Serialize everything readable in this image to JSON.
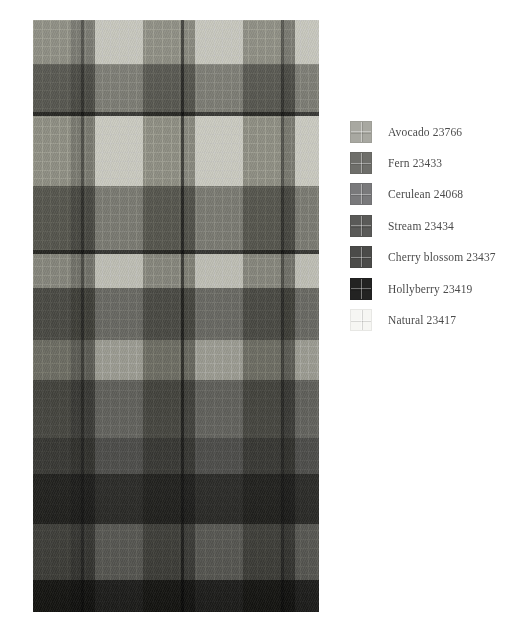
{
  "page": {
    "background": "#ffffff",
    "width": 524,
    "height": 636,
    "type": "fabric-swatch-colour-key"
  },
  "fabric": {
    "name": "plaid-swatch",
    "description": "Woven tartan / plaid fabric swatch photograph",
    "region": {
      "x": 33,
      "y": 20,
      "width": 286,
      "height": 592
    },
    "base_color": "#b9b9b1",
    "warp_columns": [
      {
        "start": 0,
        "width": 38,
        "color": "#a9a9a1",
        "yarn": "Avocado 23766"
      },
      {
        "start": 38,
        "width": 10,
        "color": "#8e8e88",
        "yarn": "Cerulean 24068"
      },
      {
        "start": 48,
        "width": 3,
        "color": "#5c5c58",
        "yarn": "Stream 23434"
      },
      {
        "start": 51,
        "width": 11,
        "color": "#8e8e88",
        "yarn": "Cerulean 24068"
      },
      {
        "start": 62,
        "width": 48,
        "color": "#f2f2ee",
        "yarn": "Natural 23417"
      },
      {
        "start": 110,
        "width": 38,
        "color": "#a9a9a1",
        "yarn": "Avocado 23766"
      },
      {
        "start": 148,
        "width": 3,
        "color": "#4a4a46",
        "yarn": "Hollyberry 23419"
      },
      {
        "start": 151,
        "width": 11,
        "color": "#a0a099",
        "yarn": "Cerulean 24068"
      },
      {
        "start": 162,
        "width": 48,
        "color": "#f2f2ee",
        "yarn": "Natural 23417"
      },
      {
        "start": 210,
        "width": 38,
        "color": "#a9a9a1",
        "yarn": "Avocado 23766"
      },
      {
        "start": 248,
        "width": 3,
        "color": "#5c5c58",
        "yarn": "Stream 23434"
      },
      {
        "start": 251,
        "width": 11,
        "color": "#8e8e88",
        "yarn": "Cerulean 24068"
      },
      {
        "start": 262,
        "width": 24,
        "color": "#f2f2ee",
        "yarn": "Natural 23417"
      }
    ],
    "weft_rows": [
      {
        "start": 0,
        "height": 44,
        "color": "#cfcfc8",
        "yarn": "Avocado 23766"
      },
      {
        "start": 44,
        "height": 48,
        "color": "#7f7f79",
        "yarn": "Fern 23433"
      },
      {
        "start": 92,
        "height": 4,
        "color": "#3a3a37",
        "yarn": "Hollyberry 23419"
      },
      {
        "start": 96,
        "height": 70,
        "color": "#d5d5ce",
        "yarn": "Avocado 23766"
      },
      {
        "start": 166,
        "height": 64,
        "color": "#808079",
        "yarn": "Fern 23433"
      },
      {
        "start": 230,
        "height": 4,
        "color": "#3a3a37",
        "yarn": "Hollyberry 23419"
      },
      {
        "start": 234,
        "height": 34,
        "color": "#c9c9c2",
        "yarn": "Avocado 23766"
      },
      {
        "start": 268,
        "height": 52,
        "color": "#6e6e69",
        "yarn": "Stream 23434"
      },
      {
        "start": 320,
        "height": 40,
        "color": "#a4a49d",
        "yarn": "Cerulean 24068"
      },
      {
        "start": 360,
        "height": 58,
        "color": "#63635f",
        "yarn": "Stream 23434"
      },
      {
        "start": 418,
        "height": 36,
        "color": "#4a4a47",
        "yarn": "Cherry blossom 23437"
      },
      {
        "start": 454,
        "height": 50,
        "color": "#232321",
        "yarn": "Hollyberry 23419"
      },
      {
        "start": 504,
        "height": 56,
        "color": "#565652",
        "yarn": "Stream 23434"
      },
      {
        "start": 560,
        "height": 32,
        "color": "#1d1d1b",
        "yarn": "Hollyberry 23419"
      }
    ]
  },
  "legend": {
    "name": "colour-key",
    "items": [
      {
        "label": "Avocado 23766",
        "color": "#a8a8a1",
        "swatch": "avocado-swatch"
      },
      {
        "label": "Fern 23433",
        "color": "#6e6e6a",
        "swatch": "fern-swatch"
      },
      {
        "label": "Cerulean 24068",
        "color": "#79797b",
        "swatch": "cerulean-swatch"
      },
      {
        "label": "Stream 23434",
        "color": "#5a5a58",
        "swatch": "stream-swatch"
      },
      {
        "label": "Cherry blossom 23437",
        "color": "#4b4b49",
        "swatch": "cherry-blossom-swatch"
      },
      {
        "label": "Hollyberry 23419",
        "color": "#232322",
        "swatch": "hollyberry-swatch"
      },
      {
        "label": "Natural 23417",
        "color": "#f6f6f3",
        "swatch": "natural-swatch"
      }
    ]
  }
}
